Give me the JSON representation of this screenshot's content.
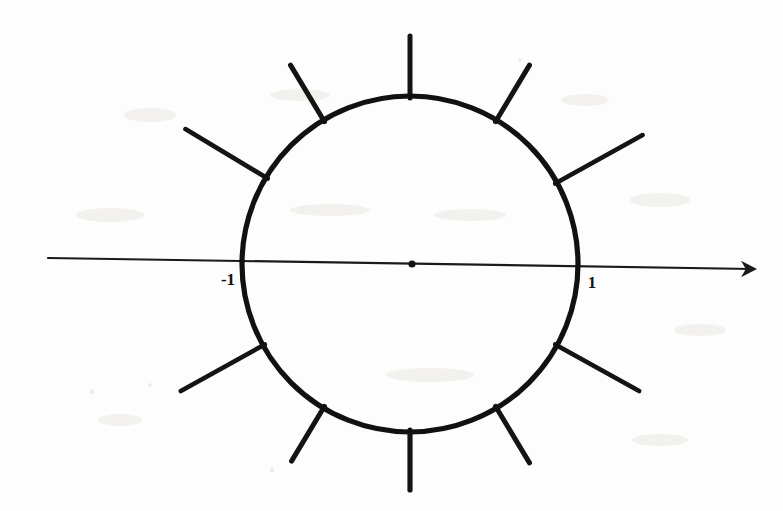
{
  "figure": {
    "background_color": "#fdfdfd",
    "ink_color": "#141413"
  },
  "axis": {
    "name": "horizontal-axis",
    "orientation": "horizontal",
    "x_start": 48,
    "y_start": 258,
    "x_end": 752,
    "y_end": 269,
    "stroke_width": 2.2,
    "arrow": {
      "name": "right-arrowhead",
      "direction": "right",
      "tip_x": 757,
      "tip_y": 269,
      "size": 16
    }
  },
  "origin": {
    "name": "origin-point",
    "cx": 412,
    "cy": 264,
    "radius": 3.6
  },
  "circle": {
    "name": "unit-circle",
    "cx": 410,
    "cy": 264,
    "r": 168,
    "stroke_width": 5.2
  },
  "labels": [
    {
      "id": "label-neg-one",
      "text": "-1",
      "x": 228,
      "y": 285,
      "anchor": "middle"
    },
    {
      "id": "label-pos-one",
      "text": "1",
      "x": 592,
      "y": 288,
      "anchor": "middle"
    }
  ],
  "rays": [
    {
      "id": "ray-1",
      "angle_deg": 90,
      "inner_r": 166,
      "outer_r": 228,
      "stroke_width": 5.0
    },
    {
      "id": "ray-2",
      "angle_deg": 59,
      "inner_r": 166,
      "outer_r": 232,
      "stroke_width": 5.0
    },
    {
      "id": "ray-3",
      "angle_deg": 29,
      "inner_r": 166,
      "outer_r": 266,
      "stroke_width": 4.6
    },
    {
      "id": "ray-4",
      "angle_deg": -29,
      "inner_r": 166,
      "outer_r": 262,
      "stroke_width": 4.6
    },
    {
      "id": "ray-5",
      "angle_deg": -59,
      "inner_r": 166,
      "outer_r": 232,
      "stroke_width": 5.0
    },
    {
      "id": "ray-6",
      "angle_deg": -90,
      "inner_r": 166,
      "outer_r": 226,
      "stroke_width": 5.2
    },
    {
      "id": "ray-7",
      "angle_deg": -121,
      "inner_r": 166,
      "outer_r": 230,
      "stroke_width": 5.0
    },
    {
      "id": "ray-8",
      "angle_deg": -151,
      "inner_r": 166,
      "outer_r": 262,
      "stroke_width": 4.6
    },
    {
      "id": "ray-9",
      "angle_deg": 149,
      "inner_r": 166,
      "outer_r": 262,
      "stroke_width": 4.6
    },
    {
      "id": "ray-10",
      "angle_deg": 121,
      "inner_r": 166,
      "outer_r": 232,
      "stroke_width": 5.0
    }
  ],
  "chart_data": {
    "type": "scatter",
    "xlabel": "",
    "ylabel": "",
    "xlim": [
      -2.2,
      2.2
    ],
    "ylim": [
      -1.5,
      1.5
    ],
    "grid": false,
    "legend": null,
    "tick_labels": [
      "-1",
      "1"
    ],
    "annotations": [
      "-1",
      "1"
    ],
    "series": [
      {
        "name": "unit-circle",
        "kind": "circle",
        "center": [
          0,
          0
        ],
        "radius": 1
      },
      {
        "name": "origin",
        "kind": "point",
        "x": [
          0
        ],
        "y": [
          0
        ]
      },
      {
        "name": "marked-axis-points",
        "kind": "point",
        "x": [
          -1,
          1
        ],
        "y": [
          0,
          0
        ],
        "labels": [
          "-1",
          "1"
        ]
      },
      {
        "name": "radial-rays",
        "kind": "ray",
        "angles_deg": [
          90,
          59,
          29,
          -29,
          -59,
          -90,
          -121,
          -151,
          149,
          121
        ],
        "from_radius": 1.0,
        "to_radius": 1.45
      }
    ]
  }
}
